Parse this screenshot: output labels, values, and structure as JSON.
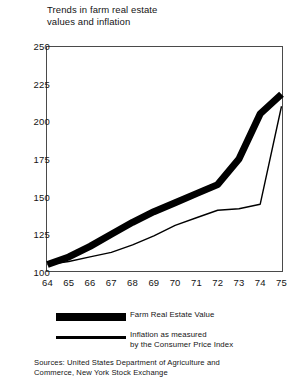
{
  "title": "Trends in farm real estate\nvalues and inflation",
  "legend": {
    "items": [
      {
        "label": "Farm Real Estate Value",
        "style": "thick-band",
        "swatch_name": "legend-swatch-farm-real-estate"
      },
      {
        "label": "Inflation as measured\nby the Consumer Price Index",
        "style": "thin-line",
        "swatch_name": "legend-swatch-inflation"
      }
    ]
  },
  "sources": "Sources: United States Department of Agriculture and\n          Commerce, New York Stock Exchange",
  "chart_data": {
    "type": "line",
    "title": "Trends in farm real estate values and inflation",
    "xlabel": "",
    "ylabel": "",
    "categories": [
      "64",
      "65",
      "66",
      "67",
      "68",
      "69",
      "70",
      "71",
      "72",
      "73",
      "74",
      "75"
    ],
    "x": [
      1964,
      1965,
      1966,
      1967,
      1968,
      1969,
      1970,
      1971,
      1972,
      1973,
      1974,
      1975
    ],
    "yticks": [
      100,
      125,
      150,
      175,
      200,
      225,
      250
    ],
    "ylim": [
      100,
      250
    ],
    "grid": false,
    "legend_position": "below-plot",
    "series": [
      {
        "name": "Farm Real Estate Value",
        "style": "thick-band",
        "color": "#000000",
        "values": [
          105,
          110,
          117,
          125,
          133,
          140,
          146,
          152,
          158,
          175,
          205,
          218
        ]
      },
      {
        "name": "Inflation as measured by the Consumer Price Index",
        "style": "thin-line",
        "color": "#000000",
        "values": [
          105,
          107,
          110,
          113,
          118,
          124,
          131,
          136,
          141,
          142,
          145,
          210
        ]
      }
    ]
  }
}
